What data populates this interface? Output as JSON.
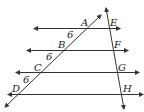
{
  "diagram": {
    "type": "geometry",
    "colors": {
      "stroke": "#333333",
      "text": "#222222",
      "background": "#ffffff"
    },
    "parallel_lines": [
      {
        "id": "line-AE",
        "points": [
          "A",
          "E"
        ]
      },
      {
        "id": "line-BF",
        "points": [
          "B",
          "F"
        ]
      },
      {
        "id": "line-CG",
        "points": [
          "C",
          "G"
        ]
      },
      {
        "id": "line-DH",
        "points": [
          "D",
          "H"
        ]
      }
    ],
    "transversals": [
      {
        "id": "transversal-ABCD",
        "points": [
          "A",
          "B",
          "C",
          "D"
        ]
      },
      {
        "id": "transversal-EFGH",
        "points": [
          "E",
          "F",
          "G",
          "H"
        ]
      }
    ],
    "point_labels": {
      "A": "A",
      "B": "B",
      "C": "C",
      "D": "D",
      "E": "E",
      "F": "F",
      "G": "G",
      "H": "H"
    },
    "segment_labels": {
      "AB": "6",
      "BC": "6",
      "CD": "6"
    }
  }
}
